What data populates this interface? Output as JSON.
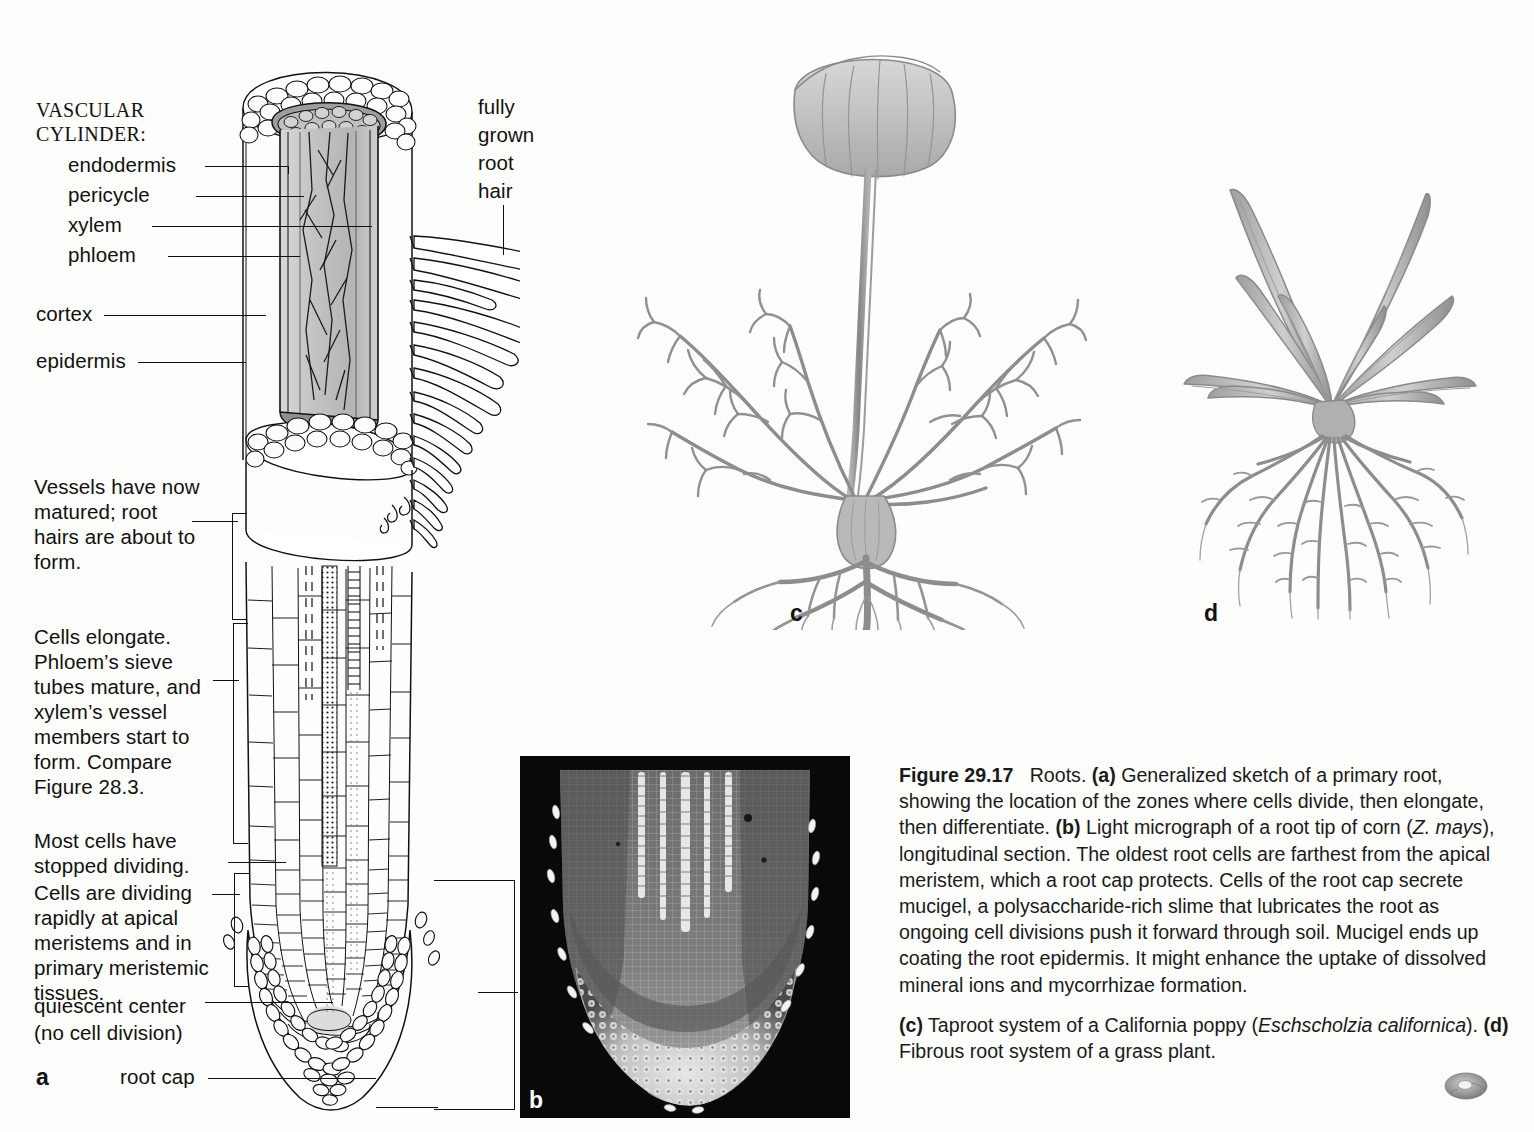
{
  "figure": {
    "panel_a_letter": "a",
    "panel_b_letter": "b",
    "panel_c_letter": "c",
    "panel_d_letter": "d"
  },
  "diagram_a": {
    "vascular_cylinder_heading_line1": "VASCULAR",
    "vascular_cylinder_heading_line2": "CYLINDER:",
    "labels": {
      "endodermis": "endodermis",
      "pericycle": "pericycle",
      "xylem": "xylem",
      "phloem": "phloem",
      "cortex": "cortex",
      "epidermis": "epidermis",
      "quiescent_center_line1": "quiescent center",
      "quiescent_center_line2": "(no cell division)",
      "root_cap": "root cap"
    },
    "root_hair_label_lines": [
      "fully",
      "grown",
      "root",
      "hair"
    ],
    "zones": {
      "zone_maturation": "Vessels have now matured; root hairs are about to form.",
      "zone_elongation": "Cells elongate. Phloem’s sieve tubes mature, and xylem’s vessel members start to form. Compare Figure 28.3.",
      "zone_stopped": "Most cells have stopped dividing.",
      "zone_division": "Cells are dividing rapidly at apical meristems and in primary meristemic tissues."
    }
  },
  "caption": {
    "figure_number": "Figure 29.17",
    "title": "Roots.",
    "para1_a_tag": "(a)",
    "para1_a_text": " Generalized sketch of a primary root, showing the location of the zones where cells divide, then elongate, then differentiate. ",
    "para1_b_tag": "(b)",
    "para1_b_text_1": " Light micrograph of a root tip of corn (",
    "para1_b_species": "Z. mays",
    "para1_b_text_2": "), longitudinal section. The oldest root cells are farthest from the apical meristem, which a root cap protects. Cells of the root cap secrete mucigel, a polysaccharide-rich slime that lubricates the root as ongoing cell divisions push it forward through soil. Mucigel ends up coating the root epidermis. It might enhance the uptake of dissolved mineral ions and mycorrhizae formation.",
    "para2_c_tag": "(c)",
    "para2_c_text_1": " Taproot system of a California poppy (",
    "para2_c_species_1": "Eschscholzia",
    "para2_c_species_2": "californica",
    "para2_c_text_2": "). ",
    "para2_d_tag": "(d)",
    "para2_d_text": " Fibrous root system of a grass plant."
  },
  "colors": {
    "ink": "#111111",
    "page_background": "#fdfdfb",
    "plant_gray": "#8a8a8a",
    "vascular_fill": "#c9c9c9",
    "micrograph_background": "#0b0b0b"
  }
}
